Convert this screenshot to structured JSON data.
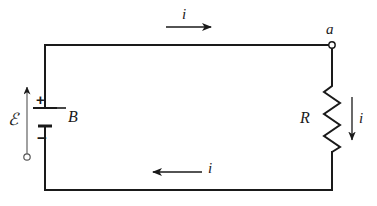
{
  "figure": {
    "type": "circuit-diagram",
    "background_color": "#ffffff",
    "line_color": "#1a1a1a"
  },
  "labels": {
    "current_top": "i",
    "current_bottom": "i",
    "current_right": "i",
    "node_a": "a",
    "resistor": "R",
    "battery": "B",
    "emf": "ℰ",
    "plus_sign": "+",
    "minus_sign": "−"
  },
  "components": {
    "battery": {
      "name": "B",
      "terminal_positive": "+",
      "terminal_negative": "−",
      "orientation": "vertical",
      "position": "left-branch"
    },
    "resistor": {
      "name": "R",
      "orientation": "vertical",
      "position": "right-branch",
      "zigzag_cycles": 6
    },
    "node": {
      "name": "a",
      "position": "top-right-corner",
      "style": "open-circle"
    },
    "emf_arrow": {
      "symbol": "ℰ",
      "direction": "up",
      "position": "left-of-battery"
    }
  },
  "arrows": {
    "top": {
      "label": "i",
      "direction": "right"
    },
    "bottom": {
      "label": "i",
      "direction": "left"
    },
    "right": {
      "label": "i",
      "direction": "down"
    },
    "emf": {
      "label": "ℰ",
      "direction": "up"
    }
  }
}
